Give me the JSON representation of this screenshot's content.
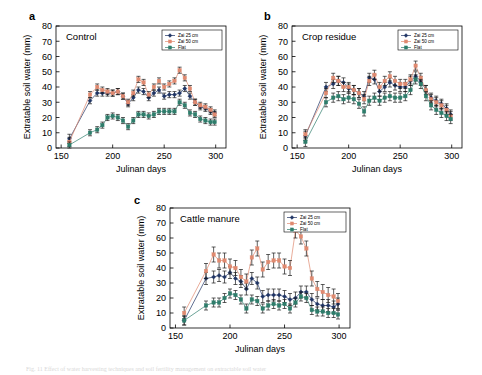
{
  "figure": {
    "caption": "Fig. 11 Effect of water harvesting techniques and soil fertility management on extractable soil water",
    "panel_letters": {
      "a": "a",
      "b": "b",
      "c": "c"
    }
  },
  "axes": {
    "xlabel": "Julinan days",
    "ylabel": "Extratable soil water (mm)",
    "xticks": [
      150,
      200,
      250,
      300
    ],
    "yticks": [
      0,
      10,
      20,
      30,
      40,
      50,
      60,
      70,
      80
    ],
    "xlim": [
      145,
      310
    ],
    "ylim": [
      0,
      80
    ]
  },
  "legend": {
    "entries": [
      {
        "label": "Zai 25 cm",
        "color": "#1f3464",
        "marker": "diamond"
      },
      {
        "label": "Zai 50 cm",
        "color": "#e08a70",
        "marker": "square"
      },
      {
        "label": "Flat",
        "color": "#2e7d6b",
        "marker": "square"
      }
    ]
  },
  "colors": {
    "zai25": "#1f3464",
    "zai50": "#e08a70",
    "flat": "#2e7d6b",
    "axis": "#000000",
    "background": "#ffffff"
  },
  "chart_data": [
    {
      "type": "line",
      "panel": "a",
      "title": "Control",
      "xlabel": "Julinan days",
      "ylabel": "Extratable soil water (mm)",
      "xlim": [
        145,
        310
      ],
      "ylim": [
        0,
        80
      ],
      "grid": false,
      "legend_position": "top-right",
      "x": [
        158,
        178,
        185,
        190,
        195,
        200,
        205,
        210,
        215,
        220,
        225,
        230,
        235,
        240,
        245,
        250,
        255,
        260,
        265,
        270,
        275,
        280,
        285,
        290,
        295,
        299
      ],
      "series": [
        {
          "name": "Zai 25 cm",
          "color": "#1f3464",
          "values": [
            6,
            31,
            36,
            36,
            36,
            36,
            37,
            34,
            29,
            33,
            38,
            37,
            33,
            36,
            38,
            34,
            35,
            35,
            36,
            39,
            34,
            30,
            27,
            26,
            24,
            23
          ],
          "error": [
            3,
            2,
            2,
            2,
            2,
            2,
            2,
            2,
            2,
            2,
            2,
            2,
            2,
            2,
            2,
            2,
            2,
            2,
            2,
            2,
            2,
            2,
            2,
            2,
            2,
            2
          ]
        },
        {
          "name": "Zai 50 cm",
          "color": "#e08a70",
          "values": [
            4,
            35,
            40,
            38,
            37,
            36,
            37,
            34,
            30,
            36,
            45,
            43,
            35,
            40,
            44,
            40,
            42,
            44,
            51,
            46,
            39,
            30,
            28,
            27,
            25,
            22
          ],
          "error": [
            3,
            2,
            2,
            2,
            2,
            2,
            2,
            2,
            2,
            2,
            2,
            2,
            2,
            2,
            2,
            2,
            2,
            2,
            2,
            2,
            2,
            2,
            2,
            2,
            2,
            2
          ]
        },
        {
          "name": "Flat",
          "color": "#2e7d6b",
          "values": [
            2,
            10,
            12,
            15,
            20,
            21,
            20,
            18,
            14,
            18,
            22,
            22,
            21,
            22,
            24,
            24,
            24,
            24,
            30,
            28,
            23,
            22,
            19,
            18,
            17,
            17
          ],
          "error": [
            2,
            2,
            2,
            2,
            2,
            2,
            2,
            2,
            2,
            2,
            2,
            2,
            2,
            2,
            2,
            2,
            2,
            2,
            2,
            2,
            2,
            2,
            2,
            2,
            2,
            2
          ]
        }
      ]
    },
    {
      "type": "line",
      "panel": "b",
      "title": "Crop residue",
      "xlabel": "Julinan days",
      "ylabel": "Extratable soil water (mm)",
      "xlim": [
        145,
        310
      ],
      "ylim": [
        0,
        80
      ],
      "grid": false,
      "legend_position": "top-right",
      "x": [
        158,
        178,
        185,
        190,
        195,
        200,
        205,
        210,
        215,
        220,
        225,
        230,
        235,
        240,
        245,
        250,
        255,
        260,
        265,
        270,
        275,
        280,
        285,
        290,
        295,
        299
      ],
      "series": [
        {
          "name": "Zai 25 cm",
          "color": "#1f3464",
          "values": [
            8,
            40,
            42,
            44,
            43,
            39,
            38,
            36,
            34,
            46,
            45,
            37,
            40,
            43,
            41,
            40,
            40,
            44,
            47,
            44,
            38,
            33,
            31,
            29,
            26,
            22
          ],
          "error": [
            3,
            3,
            3,
            3,
            3,
            3,
            3,
            3,
            3,
            3,
            3,
            3,
            3,
            3,
            3,
            3,
            3,
            3,
            3,
            3,
            3,
            3,
            3,
            3,
            3,
            3
          ]
        },
        {
          "name": "Zai 50 cm",
          "color": "#e08a70",
          "values": [
            9,
            36,
            46,
            44,
            40,
            40,
            38,
            36,
            32,
            44,
            48,
            40,
            44,
            47,
            44,
            42,
            42,
            45,
            54,
            46,
            38,
            32,
            30,
            28,
            25,
            21
          ],
          "error": [
            3,
            3,
            3,
            3,
            3,
            3,
            3,
            3,
            3,
            3,
            3,
            3,
            3,
            3,
            3,
            3,
            3,
            3,
            3,
            3,
            3,
            3,
            3,
            3,
            3,
            3
          ]
        },
        {
          "name": "Flat",
          "color": "#2e7d6b",
          "values": [
            4,
            30,
            33,
            34,
            32,
            33,
            32,
            29,
            24,
            31,
            33,
            31,
            33,
            34,
            33,
            33,
            34,
            38,
            45,
            42,
            34,
            28,
            25,
            23,
            21,
            19
          ],
          "error": [
            3,
            3,
            3,
            3,
            3,
            3,
            3,
            3,
            3,
            3,
            3,
            3,
            3,
            3,
            3,
            3,
            3,
            3,
            3,
            3,
            3,
            3,
            3,
            3,
            3,
            3
          ]
        }
      ]
    },
    {
      "type": "line",
      "panel": "c",
      "title": "Cattle manure",
      "xlabel": "Julinan days",
      "ylabel": "Extratable soil water (mm)",
      "xlim": [
        145,
        310
      ],
      "ylim": [
        0,
        80
      ],
      "grid": false,
      "legend_position": "top-right",
      "x": [
        158,
        178,
        185,
        190,
        195,
        200,
        205,
        210,
        215,
        220,
        225,
        230,
        235,
        240,
        245,
        250,
        255,
        260,
        265,
        270,
        275,
        280,
        285,
        290,
        295,
        299
      ],
      "series": [
        {
          "name": "Zai 25 cm",
          "color": "#1f3464",
          "values": [
            5,
            33,
            34,
            35,
            34,
            37,
            33,
            31,
            26,
            33,
            30,
            21,
            22,
            22,
            22,
            21,
            19,
            20,
            24,
            24,
            19,
            16,
            15,
            15,
            14,
            16
          ],
          "error": [
            3,
            4,
            4,
            4,
            4,
            4,
            4,
            4,
            4,
            4,
            4,
            4,
            4,
            4,
            4,
            4,
            4,
            4,
            4,
            4,
            4,
            4,
            4,
            4,
            4,
            4
          ]
        },
        {
          "name": "Zai 50 cm",
          "color": "#e08a70",
          "values": [
            10,
            38,
            49,
            45,
            45,
            41,
            40,
            34,
            31,
            47,
            53,
            39,
            44,
            45,
            45,
            41,
            40,
            65,
            61,
            53,
            33,
            26,
            24,
            22,
            21,
            18
          ],
          "error": [
            4,
            5,
            5,
            5,
            5,
            5,
            5,
            5,
            5,
            5,
            5,
            5,
            5,
            5,
            5,
            5,
            5,
            5,
            5,
            5,
            5,
            5,
            5,
            5,
            5,
            5
          ]
        },
        {
          "name": "Flat",
          "color": "#2e7d6b",
          "values": [
            5,
            15,
            17,
            17,
            20,
            23,
            22,
            19,
            13,
            19,
            18,
            13,
            15,
            16,
            15,
            16,
            13,
            17,
            21,
            20,
            12,
            11,
            11,
            10,
            10,
            9
          ],
          "error": [
            3,
            3,
            3,
            3,
            3,
            3,
            3,
            3,
            3,
            3,
            3,
            3,
            3,
            3,
            3,
            3,
            3,
            3,
            3,
            3,
            3,
            3,
            3,
            3,
            3,
            3
          ]
        }
      ]
    }
  ]
}
